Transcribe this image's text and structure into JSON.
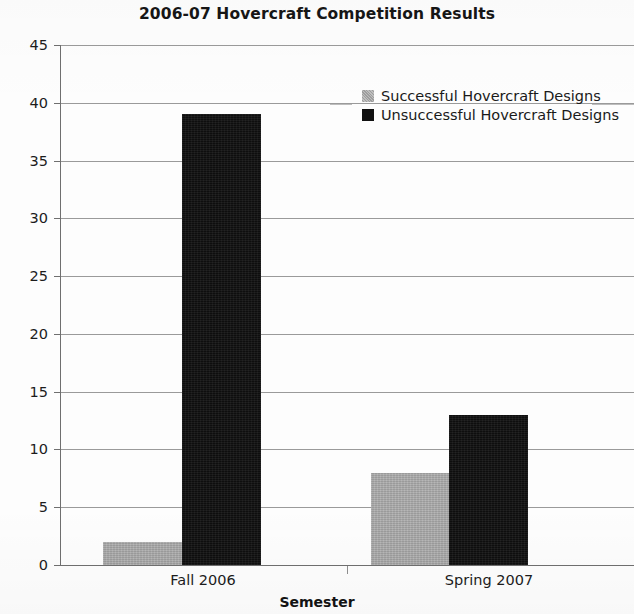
{
  "chart_data": {
    "type": "bar",
    "title": "2006-07 Hovercraft Competition Results",
    "xlabel": "Semester",
    "ylabel": "",
    "categories": [
      "Fall 2006",
      "Spring 2007"
    ],
    "series": [
      {
        "name": "Successful Hovercraft Designs",
        "color": "#a9a9a9",
        "values": [
          2,
          8
        ]
      },
      {
        "name": "Unsuccessful Hovercraft Designs",
        "color": "#111111",
        "values": [
          39,
          13
        ]
      }
    ],
    "ylim": [
      0,
      45
    ],
    "ytick_step": 5,
    "yticks": [
      45,
      40,
      35,
      30,
      25,
      20,
      15,
      10,
      5,
      0
    ],
    "ytick_labels": [
      "45",
      "40",
      "35",
      "30",
      "25",
      "20",
      "15",
      "10",
      "5",
      "0"
    ],
    "grid": "horizontal",
    "legend_position": "upper-center-right",
    "grouped": true
  },
  "title": "2006-07 Hovercraft Competition Results",
  "axes": {
    "x_title": "Semester",
    "x_categories": [
      "Fall 2006",
      "Spring 2007"
    ],
    "y_ticks": [
      "45",
      "40",
      "35",
      "30",
      "25",
      "20",
      "15",
      "10",
      "5",
      "0"
    ]
  },
  "legend": {
    "items": [
      {
        "label": "Successful Hovercraft Designs",
        "swatch": "gray-swatch-icon"
      },
      {
        "label": "Unsuccessful Hovercraft Designs",
        "swatch": "black-swatch-icon"
      }
    ]
  }
}
